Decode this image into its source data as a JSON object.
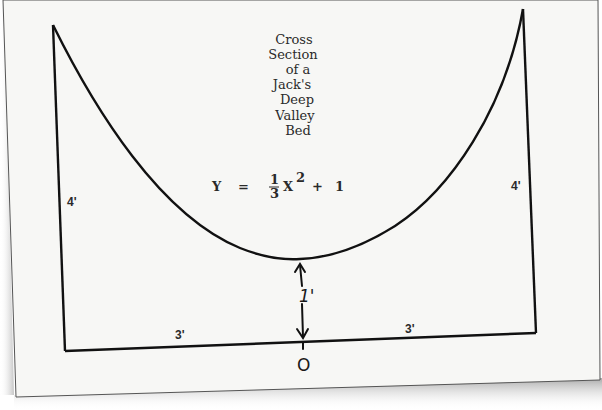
{
  "diagram": {
    "title_lines": [
      "Cross",
      "Section",
      "of a",
      "Jack's",
      "Deep",
      "Valley",
      "Bed"
    ],
    "equation": {
      "lhs": "Y",
      "equals": "=",
      "fraction_numerator": "1",
      "fraction_denominator": "3",
      "variable": "X",
      "exponent": "2",
      "plus": "+",
      "constant": "1"
    },
    "dimensions": {
      "left_wall_height": "4'",
      "right_wall_height": "4'",
      "left_half_width": "3'",
      "right_half_width": "3'",
      "min_height": "1'",
      "origin_label": "O"
    },
    "colors": {
      "paper": "#f7f7f5",
      "ink": "#111111",
      "shadow": "#9a9a9a"
    }
  }
}
